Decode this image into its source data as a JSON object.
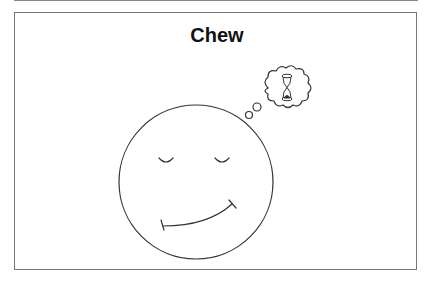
{
  "title": "Chew",
  "illustration": {
    "face": "smiling face with closed eyes",
    "thought_bubble_icon": "hourglass-icon"
  },
  "colors": {
    "stroke": "#333333",
    "frame": "#777777",
    "background": "#ffffff"
  }
}
